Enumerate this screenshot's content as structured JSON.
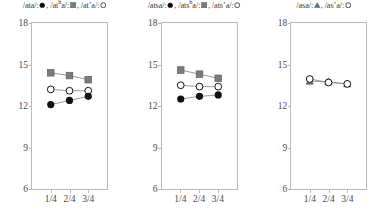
{
  "figure": {
    "panel_count": 3
  },
  "chart_data": [
    {
      "type": "line",
      "panel_index": 1,
      "title": "",
      "xlabel": "",
      "ylabel": "",
      "x": [
        "1/4",
        "2/4",
        "3/4"
      ],
      "xtick_labels": [
        "1/4",
        "2/4",
        "3/4"
      ],
      "ytick_labels": [
        "18",
        "15",
        "12",
        "9",
        "6"
      ],
      "yticks": [
        18,
        15,
        12,
        9,
        6
      ],
      "ylim": [
        6,
        18
      ],
      "grid": false,
      "legend_position": "above",
      "legend_entries": [
        {
          "label": "/ata/",
          "marker": "filled-circle",
          "color": "#111111"
        },
        {
          "label": "/atʰa/",
          "marker": "filled-square",
          "color": "#7b7b7b"
        },
        {
          "label": "/at’a/",
          "marker": "open-circle",
          "color": "#111111"
        }
      ],
      "series": [
        {
          "name": "/atʰa/",
          "marker": "filled-square",
          "color": "#7b7b7b",
          "values": [
            14.4,
            14.2,
            13.9
          ]
        },
        {
          "name": "/at’a/",
          "marker": "open-circle",
          "color": "#111111",
          "values": [
            13.2,
            13.1,
            13.1
          ]
        },
        {
          "name": "/ata/",
          "marker": "filled-circle",
          "color": "#111111",
          "values": [
            12.1,
            12.4,
            12.7
          ]
        }
      ]
    },
    {
      "type": "line",
      "panel_index": 2,
      "title": "",
      "xlabel": "",
      "ylabel": "",
      "x": [
        "1/4",
        "2/4",
        "3/4"
      ],
      "xtick_labels": [
        "1/4",
        "2/4",
        "3/4"
      ],
      "ytick_labels": [
        "18",
        "15",
        "12",
        "9",
        "6"
      ],
      "yticks": [
        18,
        15,
        12,
        9,
        6
      ],
      "ylim": [
        6,
        18
      ],
      "grid": false,
      "legend_position": "above",
      "legend_entries": [
        {
          "label": "/atsa/",
          "marker": "filled-circle",
          "color": "#111111"
        },
        {
          "label": "/atsʰa/",
          "marker": "filled-square",
          "color": "#7b7b7b"
        },
        {
          "label": "/ats’a/",
          "marker": "open-circle",
          "color": "#111111"
        }
      ],
      "series": [
        {
          "name": "/atsʰa/",
          "marker": "filled-square",
          "color": "#7b7b7b",
          "values": [
            14.6,
            14.3,
            14.0
          ]
        },
        {
          "name": "/ats’a/",
          "marker": "open-circle",
          "color": "#111111",
          "values": [
            13.5,
            13.4,
            13.4
          ]
        },
        {
          "name": "/atsa/",
          "marker": "filled-circle",
          "color": "#111111",
          "values": [
            12.5,
            12.7,
            12.8
          ]
        }
      ]
    },
    {
      "type": "line",
      "panel_index": 3,
      "title": "",
      "xlabel": "",
      "ylabel": "",
      "x": [
        "1/4",
        "2/4",
        "3/4"
      ],
      "xtick_labels": [
        "1/4",
        "2/4",
        "3/4"
      ],
      "ytick_labels": [
        "18",
        "15",
        "12",
        "9",
        "6"
      ],
      "yticks": [
        18,
        15,
        12,
        9,
        6
      ],
      "ylim": [
        6,
        18
      ],
      "grid": false,
      "legend_position": "above",
      "legend_entries": [
        {
          "label": "/asa/",
          "marker": "filled-triangle",
          "color": "#6f6f6f"
        },
        {
          "label": "/as’a/",
          "marker": "open-circle",
          "color": "#111111"
        }
      ],
      "series": [
        {
          "name": "/asa/",
          "marker": "filled-triangle",
          "color": "#6f6f6f",
          "values": [
            13.8,
            13.75,
            13.6
          ]
        },
        {
          "name": "/as’a/",
          "marker": "open-circle",
          "color": "#111111",
          "values": [
            13.95,
            13.7,
            13.6
          ]
        }
      ]
    }
  ]
}
